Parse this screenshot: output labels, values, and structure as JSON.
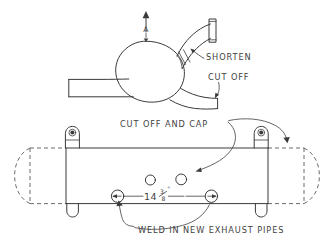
{
  "document": {
    "title": "Exhaust System Modification Sketch",
    "medium": "hand-drawn pencil sketch",
    "background_color": "#ffffff",
    "ink_color": "#3a3a3a"
  },
  "figures": [
    {
      "id": "top-view-turbo",
      "name": "turbo-housing-assembly",
      "description": "Round housing with outlet pipe to upper right ending in a flange, and a lower right pipe plus a left side pipe stub"
    },
    {
      "id": "bottom-view-muffler",
      "name": "muffler-body-plan-view",
      "description": "Rectangular muffler body shown solid with dashed original rounded ends, two mounting tabs on top, two on bottom, four ports on the face"
    }
  ],
  "annotations": {
    "shorten": {
      "text": "SHORTEN",
      "target": "upper-right-outlet-pipe"
    },
    "cut_off": {
      "text": "CUT OFF",
      "target": "lower-right-pipe-end"
    },
    "cut_off_and_cap": {
      "text": "CUT OFF AND CAP",
      "target": "muffler-port-and-right-tab"
    },
    "weld_in_new_exhaust_pipes": {
      "text": "WELD IN NEW EXHAUST PIPES",
      "target": "muffler-lower-ports"
    },
    "section_mark": {
      "letter": "A",
      "direction": "up"
    }
  },
  "dimensions": {
    "port_spacing": {
      "whole": "14",
      "numerator": "3",
      "denominator": "8",
      "unit": "\"",
      "full_text": "14 3/8\"",
      "between": "lower-left-port and lower-right-port"
    }
  },
  "features": {
    "muffler_ports": [
      {
        "name": "upper-left-port",
        "capped": false
      },
      {
        "name": "upper-right-port",
        "capped": true
      },
      {
        "name": "lower-left-port",
        "new_pipe": true
      },
      {
        "name": "lower-right-port",
        "new_pipe": true
      }
    ],
    "mounting_tabs": [
      {
        "name": "top-left-tab"
      },
      {
        "name": "top-right-tab"
      },
      {
        "name": "bottom-left-tab"
      },
      {
        "name": "bottom-right-tab"
      }
    ]
  }
}
